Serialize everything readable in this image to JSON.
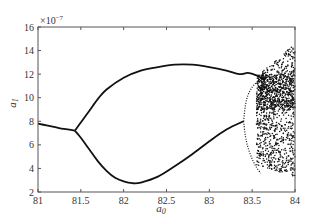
{
  "chart_data": {
    "type": "scatter",
    "title": "",
    "subtitle": "",
    "xlabel": "a0",
    "ylabel": "a1",
    "y_scale_annotation": "×10^-7",
    "xlim": [
      81,
      84
    ],
    "ylim": [
      2,
      16
    ],
    "x_ticks": [
      81,
      81.5,
      82,
      82.5,
      83,
      83.5,
      84
    ],
    "x_tick_labels": [
      "81",
      "81.5",
      "82",
      "82.5",
      "83",
      "83.5",
      "84"
    ],
    "y_ticks": [
      2,
      4,
      6,
      8,
      10,
      12,
      14,
      16
    ],
    "y_tick_labels": [
      "2",
      "4",
      "6",
      "8",
      "10",
      "12",
      "14",
      "16"
    ],
    "grid": false,
    "legend": null,
    "series": [
      {
        "name": "single branch",
        "x": [
          81.0,
          81.1,
          81.2,
          81.3,
          81.4,
          81.43
        ],
        "y": [
          7.8,
          7.65,
          7.5,
          7.35,
          7.25,
          7.2
        ]
      },
      {
        "name": "upper branch",
        "x": [
          81.43,
          81.5,
          81.6,
          81.7,
          81.8,
          82.0,
          82.2,
          82.4,
          82.6,
          82.8,
          83.0,
          83.2,
          83.35,
          83.45,
          83.55,
          83.65
        ],
        "y": [
          7.2,
          7.9,
          8.9,
          9.9,
          10.7,
          11.7,
          12.3,
          12.6,
          12.8,
          12.8,
          12.6,
          12.3,
          12.0,
          12.1,
          11.9,
          11.5
        ]
      },
      {
        "name": "lower branch",
        "x": [
          81.43,
          81.5,
          81.6,
          81.7,
          81.8,
          81.9,
          82.0,
          82.1,
          82.2,
          82.4,
          82.6,
          82.8,
          83.0,
          83.2,
          83.4
        ],
        "y": [
          7.2,
          6.6,
          5.6,
          4.6,
          3.8,
          3.2,
          2.9,
          2.75,
          2.8,
          3.3,
          4.2,
          5.2,
          6.3,
          7.3,
          8.0
        ]
      },
      {
        "name": "period-doubled lower",
        "x": [
          83.4,
          83.42,
          83.45,
          83.5,
          83.55,
          83.6,
          83.65
        ],
        "y": [
          8.0,
          9.3,
          10.2,
          10.9,
          11.3,
          11.6,
          11.8
        ]
      },
      {
        "name": "period-doubled lower2",
        "x": [
          83.4,
          83.42,
          83.45,
          83.5,
          83.55,
          83.6
        ],
        "y": [
          8.0,
          6.8,
          5.8,
          4.8,
          4.1,
          3.6
        ]
      },
      {
        "name": "chaotic region",
        "x_range": [
          83.55,
          84.0
        ],
        "y_range": [
          3.3,
          14.5
        ]
      }
    ]
  }
}
